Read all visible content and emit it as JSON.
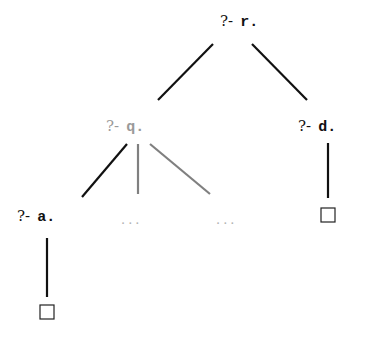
{
  "diagram": {
    "type": "sld-resolution-tree",
    "colors": {
      "active": "#111111",
      "inactive": "#9a9a9a",
      "inactive_edge": "#808080",
      "faint": "#b0b0b0"
    },
    "nodes": [
      {
        "id": "r",
        "prefix": "?-",
        "atom": "r.",
        "x": 220,
        "y": 26,
        "color_key": "active"
      },
      {
        "id": "q",
        "prefix": "?-",
        "atom": "q.",
        "x": 106,
        "y": 131,
        "color_key": "inactive"
      },
      {
        "id": "d",
        "prefix": "?-",
        "atom": "d.",
        "x": 298,
        "y": 131,
        "color_key": "active"
      },
      {
        "id": "a",
        "prefix": "?-",
        "atom": "a.",
        "x": 17,
        "y": 221,
        "color_key": "active"
      }
    ],
    "ellipses": [
      {
        "id": "dots1",
        "text": "...",
        "x": 121,
        "y": 224
      },
      {
        "id": "dots2",
        "text": "...",
        "x": 216,
        "y": 224
      }
    ],
    "empty_clauses": [
      {
        "id": "box-d",
        "x": 321,
        "y": 208,
        "size": 14
      },
      {
        "id": "box-a",
        "x": 40,
        "y": 305,
        "size": 14
      }
    ],
    "edges": [
      {
        "from": "r",
        "to": "q",
        "x1": 213,
        "y1": 44,
        "x2": 158,
        "y2": 100,
        "color_key": "active"
      },
      {
        "from": "r",
        "to": "d",
        "x1": 252,
        "y1": 44,
        "x2": 307,
        "y2": 100,
        "color_key": "active"
      },
      {
        "from": "q",
        "to": "a",
        "x1": 127,
        "y1": 144,
        "x2": 82,
        "y2": 197,
        "color_key": "active"
      },
      {
        "from": "q",
        "to": "dots1",
        "x1": 138,
        "y1": 144,
        "x2": 138,
        "y2": 194,
        "color_key": "inactive_edge"
      },
      {
        "from": "q",
        "to": "dots2",
        "x1": 150,
        "y1": 144,
        "x2": 210,
        "y2": 194,
        "color_key": "inactive_edge"
      },
      {
        "from": "d",
        "to": "box-d",
        "x1": 328,
        "y1": 143,
        "x2": 328,
        "y2": 198,
        "color_key": "active"
      },
      {
        "from": "a",
        "to": "box-a",
        "x1": 47,
        "y1": 238,
        "x2": 47,
        "y2": 297,
        "color_key": "active"
      }
    ]
  }
}
